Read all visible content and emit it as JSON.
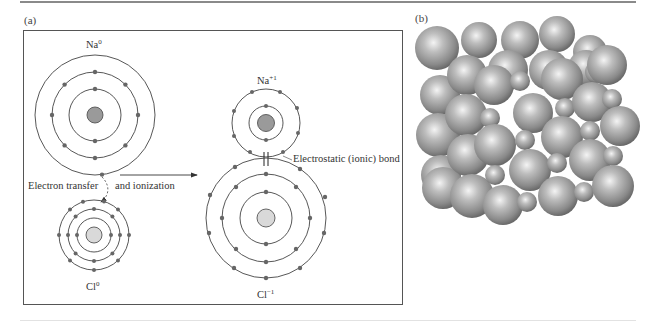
{
  "figure": {
    "panel_a": {
      "label": "(a)",
      "atoms": {
        "na0": {
          "symbol": "Na",
          "charge": "0"
        },
        "cl0": {
          "symbol": "Cl",
          "charge": "0"
        },
        "na_ion": {
          "symbol": "Na",
          "charge": "+1"
        },
        "cl_ion": {
          "symbol": "Cl",
          "charge": "−1"
        }
      },
      "annotations": {
        "electron_transfer": "Electron transfer",
        "and_ionization": "and ionization",
        "bond": "Electrostatic (ionic) bond"
      }
    },
    "panel_b": {
      "label": "(b)",
      "description": "NaCl crystal lattice sphere packing model"
    },
    "colors": {
      "line": "#444444",
      "electron": "#6a6a6a",
      "na_nucleus": "#9a9a9a",
      "cl_nucleus": "#d9d9d9",
      "sphere_light": "#e8e8e8",
      "sphere_dark": "#6e6e6e"
    }
  }
}
